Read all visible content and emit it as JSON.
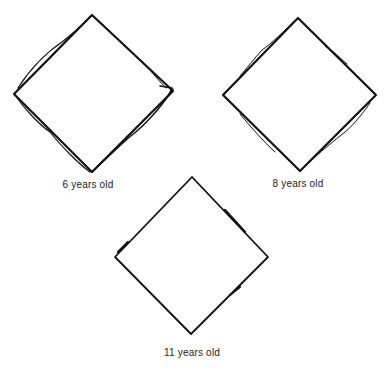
{
  "figure": {
    "drawings": [
      {
        "label": "6 years old",
        "description": "hand-drawn diamond copy with doubled, overlapping strokes"
      },
      {
        "label": "8 years old",
        "description": "hand-drawn diamond copy with slight doubled strokes"
      },
      {
        "label": "11 years old",
        "description": "hand-drawn diamond copy with clean single strokes"
      }
    ],
    "stroke_color": "#111111",
    "background": "#ffffff"
  }
}
